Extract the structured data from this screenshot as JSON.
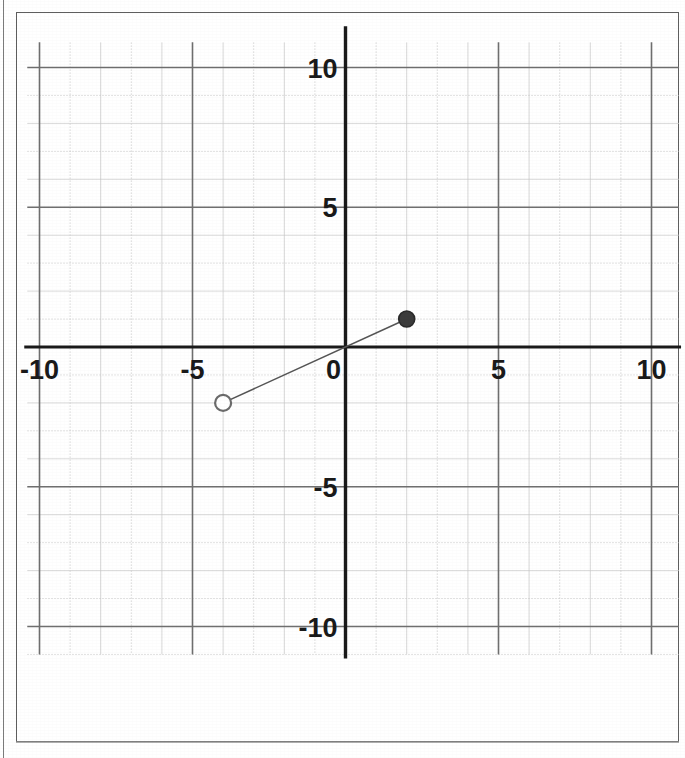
{
  "document": {
    "kind": "scanned-worksheet-graph",
    "background_color": "#ffffff",
    "border_color": "#5e5e5e"
  },
  "chart_data": {
    "type": "line",
    "title": "",
    "subtitle": "",
    "xlabel": "",
    "ylabel": "",
    "xlim": [
      -11,
      11
    ],
    "ylim": [
      -11,
      11
    ],
    "grid": true,
    "minor_grid": true,
    "minor_grid_step": 1,
    "major_grid_step": 5,
    "axis_color": "#1a1a1a",
    "grid_color": "#9a9a9a",
    "minor_grid_color": "#c9c9c9",
    "legend": "none",
    "x_tick_labels": [
      "-10",
      "-5",
      "0",
      "5",
      "10"
    ],
    "x_tick_values": [
      -10,
      -5,
      0,
      5,
      10
    ],
    "y_tick_labels": [
      "10",
      "5",
      "-5",
      "-10"
    ],
    "y_tick_values": [
      10,
      5,
      -5,
      -10
    ],
    "origin_label": "0",
    "series": [
      {
        "name": "segment",
        "type": "line-segment",
        "color": "#555555",
        "line_width": 1.5,
        "points": [
          {
            "x": -4,
            "y": -2,
            "marker": "open-circle",
            "label": "(-4, -2)"
          },
          {
            "x": 2,
            "y": 1,
            "marker": "filled-circle",
            "label": "(2, 1)"
          }
        ],
        "slope": "1/2",
        "y_intercept": 0
      }
    ],
    "annotations": []
  },
  "markers": {
    "open_circle": {
      "name": "open-endpoint",
      "fill": "#ffffff",
      "stroke": "#6b6b6b",
      "radius": 8
    },
    "filled_circle": {
      "name": "closed-endpoint",
      "fill": "#3b3b3b",
      "stroke": "#2a2a2a",
      "radius": 8
    }
  }
}
